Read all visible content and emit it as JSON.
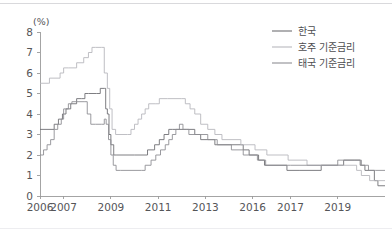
{
  "figure": {
    "unit_label": "(%)",
    "background": "#ffffff",
    "rule_color": "#d9d9dc"
  },
  "legend": {
    "position": "top-right",
    "items": [
      {
        "label": "한국",
        "color": "#6f6f74"
      },
      {
        "label": "호주 기준금리",
        "color": "#b8b8bd"
      },
      {
        "label": "태국 기준금리",
        "color": "#8e8e94"
      }
    ]
  },
  "chart_data": {
    "type": "line",
    "title": "",
    "subtitle": "",
    "xlabel": "",
    "ylabel": "(%)",
    "ylim": [
      0,
      8
    ],
    "yticks": [
      0,
      1,
      2,
      3,
      4,
      5,
      6,
      7,
      8
    ],
    "xtick_labels": [
      "2006",
      "2007",
      "2009",
      "2011",
      "2013",
      "2016",
      "2017",
      "2019"
    ],
    "xtick_positions": [
      2006.0,
      2007.0,
      2009.0,
      2011.0,
      2013.0,
      2015.0,
      2016.6,
      2018.6
    ],
    "xlim": [
      2006.0,
      2020.6
    ],
    "grid": false,
    "line_style": "step-post",
    "legend_position": "top-right",
    "series": [
      {
        "name": "한국",
        "color": "#6f6f74",
        "points": [
          [
            2006.0,
            3.25
          ],
          [
            2006.55,
            3.25
          ],
          [
            2006.6,
            3.5
          ],
          [
            2006.78,
            3.75
          ],
          [
            2006.95,
            4.0
          ],
          [
            2007.1,
            4.25
          ],
          [
            2007.3,
            4.5
          ],
          [
            2007.55,
            4.75
          ],
          [
            2007.75,
            4.75
          ],
          [
            2007.9,
            5.0
          ],
          [
            2008.05,
            5.0
          ],
          [
            2008.4,
            5.0
          ],
          [
            2008.55,
            5.25
          ],
          [
            2008.72,
            5.25
          ],
          [
            2008.78,
            4.25
          ],
          [
            2008.85,
            4.0
          ],
          [
            2008.92,
            3.0
          ],
          [
            2009.0,
            2.5
          ],
          [
            2009.12,
            2.0
          ],
          [
            2009.25,
            2.0
          ],
          [
            2010.0,
            2.0
          ],
          [
            2010.55,
            2.25
          ],
          [
            2010.85,
            2.5
          ],
          [
            2011.05,
            2.75
          ],
          [
            2011.25,
            3.0
          ],
          [
            2011.45,
            3.25
          ],
          [
            2011.6,
            3.25
          ],
          [
            2012.2,
            3.25
          ],
          [
            2012.55,
            3.0
          ],
          [
            2012.8,
            2.75
          ],
          [
            2013.4,
            2.5
          ],
          [
            2014.0,
            2.5
          ],
          [
            2014.6,
            2.25
          ],
          [
            2014.85,
            2.0
          ],
          [
            2015.25,
            1.75
          ],
          [
            2015.5,
            1.5
          ],
          [
            2016.45,
            1.25
          ],
          [
            2017.0,
            1.25
          ],
          [
            2017.9,
            1.5
          ],
          [
            2018.85,
            1.75
          ],
          [
            2019.55,
            1.5
          ],
          [
            2019.75,
            1.25
          ],
          [
            2020.15,
            0.75
          ],
          [
            2020.3,
            0.5
          ],
          [
            2020.6,
            0.5
          ]
        ]
      },
      {
        "name": "호주 기준금리",
        "color": "#b8b8bd",
        "points": [
          [
            2006.0,
            5.5
          ],
          [
            2006.35,
            5.5
          ],
          [
            2006.4,
            5.75
          ],
          [
            2006.85,
            6.0
          ],
          [
            2007.0,
            6.25
          ],
          [
            2007.2,
            6.25
          ],
          [
            2007.55,
            6.5
          ],
          [
            2007.85,
            6.75
          ],
          [
            2008.05,
            7.0
          ],
          [
            2008.2,
            7.25
          ],
          [
            2008.35,
            7.25
          ],
          [
            2008.6,
            7.25
          ],
          [
            2008.72,
            6.0
          ],
          [
            2008.85,
            5.25
          ],
          [
            2008.95,
            4.25
          ],
          [
            2009.05,
            3.25
          ],
          [
            2009.2,
            3.0
          ],
          [
            2009.7,
            3.0
          ],
          [
            2009.85,
            3.25
          ],
          [
            2010.0,
            3.5
          ],
          [
            2010.15,
            3.75
          ],
          [
            2010.3,
            4.0
          ],
          [
            2010.45,
            4.25
          ],
          [
            2010.6,
            4.5
          ],
          [
            2010.9,
            4.5
          ],
          [
            2011.05,
            4.75
          ],
          [
            2011.4,
            4.75
          ],
          [
            2012.0,
            4.75
          ],
          [
            2012.15,
            4.5
          ],
          [
            2012.35,
            4.25
          ],
          [
            2012.55,
            4.0
          ],
          [
            2012.8,
            3.5
          ],
          [
            2013.1,
            3.25
          ],
          [
            2013.4,
            3.0
          ],
          [
            2013.7,
            2.75
          ],
          [
            2014.5,
            2.5
          ],
          [
            2015.1,
            2.25
          ],
          [
            2015.6,
            2.0
          ],
          [
            2016.5,
            1.75
          ],
          [
            2017.3,
            1.5
          ],
          [
            2018.4,
            1.5
          ],
          [
            2019.4,
            1.25
          ],
          [
            2019.6,
            1.0
          ],
          [
            2019.95,
            0.75
          ],
          [
            2020.2,
            0.75
          ],
          [
            2020.6,
            0.75
          ]
        ]
      },
      {
        "name": "태국 기준금리",
        "color": "#8e8e94",
        "points": [
          [
            2006.0,
            2.0
          ],
          [
            2006.15,
            2.25
          ],
          [
            2006.3,
            2.5
          ],
          [
            2006.45,
            2.75
          ],
          [
            2006.6,
            3.25
          ],
          [
            2006.75,
            3.5
          ],
          [
            2006.9,
            3.75
          ],
          [
            2007.0,
            4.25
          ],
          [
            2007.2,
            4.5
          ],
          [
            2007.35,
            4.6
          ],
          [
            2007.55,
            4.6
          ],
          [
            2007.9,
            4.6
          ],
          [
            2008.0,
            4.0
          ],
          [
            2008.15,
            3.5
          ],
          [
            2008.35,
            3.5
          ],
          [
            2008.6,
            3.5
          ],
          [
            2008.72,
            3.75
          ],
          [
            2008.8,
            3.5
          ],
          [
            2008.9,
            2.75
          ],
          [
            2009.0,
            2.0
          ],
          [
            2009.1,
            1.5
          ],
          [
            2009.22,
            1.25
          ],
          [
            2009.4,
            1.25
          ],
          [
            2010.3,
            1.25
          ],
          [
            2010.45,
            1.5
          ],
          [
            2010.7,
            1.75
          ],
          [
            2010.9,
            2.0
          ],
          [
            2011.1,
            2.25
          ],
          [
            2011.3,
            2.5
          ],
          [
            2011.45,
            2.75
          ],
          [
            2011.6,
            3.0
          ],
          [
            2011.75,
            3.25
          ],
          [
            2011.9,
            3.5
          ],
          [
            2012.05,
            3.25
          ],
          [
            2012.3,
            3.0
          ],
          [
            2012.6,
            3.0
          ],
          [
            2013.1,
            2.75
          ],
          [
            2013.5,
            2.5
          ],
          [
            2014.1,
            2.25
          ],
          [
            2014.6,
            2.0
          ],
          [
            2015.2,
            1.75
          ],
          [
            2015.55,
            1.5
          ],
          [
            2016.6,
            1.5
          ],
          [
            2018.6,
            1.75
          ],
          [
            2019.3,
            1.75
          ],
          [
            2019.6,
            1.5
          ],
          [
            2019.9,
            1.25
          ],
          [
            2020.2,
            1.25
          ],
          [
            2020.6,
            1.25
          ]
        ]
      }
    ]
  }
}
